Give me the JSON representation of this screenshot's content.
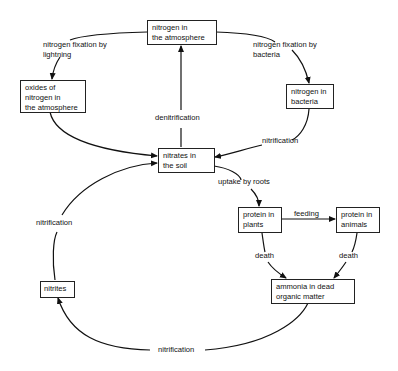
{
  "diagram": {
    "nodes": {
      "atmosphere": {
        "line1": "nitrogen in",
        "line2": "the atmosphere"
      },
      "oxides": {
        "line1": "oxides of",
        "line2": "nitrogen in",
        "line3": "the atmosphere"
      },
      "bacteria": {
        "line1": "nitrogen in",
        "line2": "bacteria"
      },
      "nitrates": {
        "line1": "nitrates in",
        "line2": "the soil"
      },
      "plants": {
        "line1": "protein in",
        "line2": "plants"
      },
      "animals": {
        "line1": "protein in",
        "line2": "animals"
      },
      "ammonia": {
        "line1": "ammonia in dead",
        "line2": "organic matter"
      },
      "nitrites": {
        "line1": "nitrites"
      }
    },
    "edges": {
      "lightning": {
        "line1": "nitrogen fixation by",
        "line2": "lightning"
      },
      "bacteria_fix": {
        "line1": "nitrogen fixation by",
        "line2": "bacteria"
      },
      "denitrification": "denitrification",
      "nitrification_bacteria": "nitrification",
      "uptake": "uptake by roots",
      "feeding": "feeding",
      "death_plants": "death",
      "death_animals": "death",
      "nitrification_nitrites": "nitrification",
      "nitrification_bottom": "nitrification"
    }
  }
}
